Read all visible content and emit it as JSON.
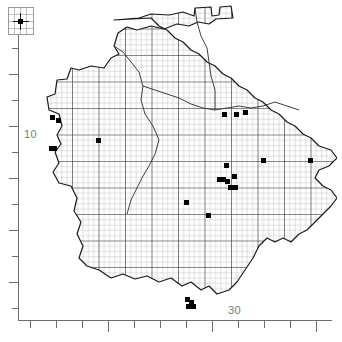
{
  "figure": {
    "type": "distribution-dot-map"
  },
  "axes": {
    "y_label": "10",
    "x_label": "30",
    "y_label_position_px": {
      "x": 24,
      "y": 128
    },
    "x_label_position_px": {
      "x": 228,
      "y": 304
    },
    "y_ticks_px": [
      22,
      48,
      74,
      100,
      126,
      152,
      178,
      204,
      230,
      256,
      282,
      308
    ],
    "y_major_ticks_px": [
      74,
      126,
      178,
      230,
      282
    ],
    "x_ticks_px": [
      30,
      56,
      82,
      108,
      134,
      160,
      186,
      212,
      238,
      264,
      290,
      316
    ],
    "x_major_ticks_px": [
      108,
      212,
      316
    ],
    "axis_color": "#6e6e6e",
    "label_color": "#7a7a7a"
  },
  "legend": {
    "box_label": "symbol-key",
    "symbol": "filled-square",
    "symbol_color": "#000000",
    "grid_color": "#bdbdbd"
  },
  "grid": {
    "minor_spacing_px": 5.3,
    "major_spacing_px": 26.5,
    "minor_color": "#b4b4b4",
    "major_color": "#2b2b2b",
    "outline_color": "#1a1a1a"
  },
  "chart_data": {
    "type": "scatter",
    "title": "",
    "xlabel": "30",
    "ylabel": "10",
    "records": [
      {
        "x": 33,
        "y": 115
      },
      {
        "x": 39,
        "y": 118
      },
      {
        "x": 32,
        "y": 146
      },
      {
        "x": 35,
        "y": 146
      },
      {
        "x": 79,
        "y": 138
      },
      {
        "x": 167,
        "y": 200
      },
      {
        "x": 189,
        "y": 213
      },
      {
        "x": 207,
        "y": 163
      },
      {
        "x": 200,
        "y": 177
      },
      {
        "x": 204,
        "y": 177
      },
      {
        "x": 208,
        "y": 179
      },
      {
        "x": 215,
        "y": 174
      },
      {
        "x": 211,
        "y": 185
      },
      {
        "x": 216,
        "y": 185
      },
      {
        "x": 205,
        "y": 112
      },
      {
        "x": 217,
        "y": 112
      },
      {
        "x": 226,
        "y": 110
      },
      {
        "x": 244,
        "y": 158
      },
      {
        "x": 291,
        "y": 158
      },
      {
        "x": 168,
        "y": 297
      },
      {
        "x": 172,
        "y": 300
      },
      {
        "x": 169,
        "y": 304
      },
      {
        "x": 174,
        "y": 304
      }
    ]
  },
  "dots_px": [
    {
      "x": 52,
      "y": 117,
      "name": "record-marker"
    },
    {
      "x": 58,
      "y": 120,
      "name": "record-marker"
    },
    {
      "x": 51,
      "y": 148,
      "name": "record-marker"
    },
    {
      "x": 54,
      "y": 148,
      "name": "record-marker"
    },
    {
      "x": 98,
      "y": 140,
      "name": "record-marker"
    },
    {
      "x": 186,
      "y": 202,
      "name": "record-marker"
    },
    {
      "x": 208,
      "y": 215,
      "name": "record-marker"
    },
    {
      "x": 226,
      "y": 165,
      "name": "record-marker"
    },
    {
      "x": 219,
      "y": 179,
      "name": "record-marker"
    },
    {
      "x": 223,
      "y": 179,
      "name": "record-marker"
    },
    {
      "x": 227,
      "y": 181,
      "name": "record-marker"
    },
    {
      "x": 234,
      "y": 176,
      "name": "record-marker"
    },
    {
      "x": 230,
      "y": 187,
      "name": "record-marker"
    },
    {
      "x": 235,
      "y": 187,
      "name": "record-marker"
    },
    {
      "x": 224,
      "y": 114,
      "name": "record-marker"
    },
    {
      "x": 236,
      "y": 114,
      "name": "record-marker"
    },
    {
      "x": 245,
      "y": 112,
      "name": "record-marker"
    },
    {
      "x": 263,
      "y": 160,
      "name": "record-marker"
    },
    {
      "x": 310,
      "y": 160,
      "name": "record-marker"
    },
    {
      "x": 187,
      "y": 299,
      "name": "record-marker"
    },
    {
      "x": 191,
      "y": 302,
      "name": "record-marker"
    },
    {
      "x": 188,
      "y": 306,
      "name": "record-marker"
    },
    {
      "x": 193,
      "y": 306,
      "name": "record-marker"
    }
  ],
  "map_outline_path": "M 95 18 L 120 16 L 132 12 L 150 13 L 164 10 L 175 14 L 176 6 L 192 5 L 193 14 L 200 13 L 201 5 L 212 4 L 214 16 L 197 17 L 190 22 L 179 20 L 170 24 L 158 22 L 145 27 L 132 24 L 118 28 L 108 25 L 99 31 L 95 44 L 100 52 L 92 56 L 85 66 L 72 64 L 60 68 L 52 66 L 48 77 L 38 78 L 36 92 L 28 95 L 30 108 L 40 112 L 43 124 L 38 133 L 42 142 L 36 150 L 40 161 L 34 170 L 40 181 L 52 184 L 58 196 L 55 209 L 62 220 L 58 232 L 64 244 L 60 256 L 68 264 L 80 268 L 92 276 L 104 272 L 116 277 L 128 274 L 140 280 L 152 276 L 163 284 L 172 280 L 182 288 L 190 284 L 198 292 L 210 288 L 218 280 L 226 268 L 234 256 L 240 244 L 248 236 L 256 240 L 264 236 L 272 240 L 280 232 L 288 228 L 296 220 L 304 212 L 312 204 L 318 196 L 312 188 L 304 184 L 296 176 L 300 168 L 310 164 L 318 156 L 312 148 L 300 144 L 292 136 L 284 132 L 276 124 L 268 120 L 260 112 L 252 108 L 244 100 L 236 96 L 228 88 L 220 84 L 212 76 L 204 72 L 196 64 L 188 60 L 180 52 L 172 48 L 164 40 L 156 36 L 148 28 L 140 24 L 132 16 Z"
}
